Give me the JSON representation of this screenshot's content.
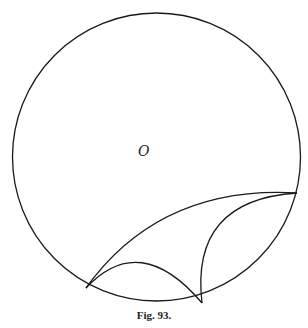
{
  "figure": {
    "center_label": "O",
    "caption": "Fig. 93.",
    "stroke_color": "#1a1a1a",
    "circle": {
      "cx": 156.5,
      "cy": 157,
      "r": 144
    },
    "points": {
      "A": [
        86,
        288
      ],
      "B": [
        202,
        303
      ],
      "C": [
        297,
        193
      ]
    }
  }
}
